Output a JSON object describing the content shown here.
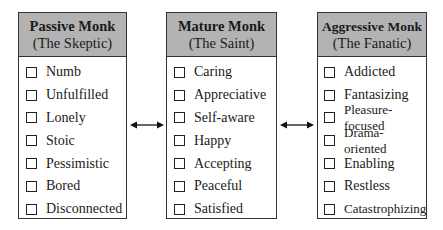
{
  "columns": [
    {
      "title": "Passive Monk",
      "subtitle": "(The Skeptic)",
      "items": [
        "Numb",
        "Unfulfilled",
        "Lonely",
        "Stoic",
        "Pessimistic",
        "Bored",
        "Disconnected"
      ]
    },
    {
      "title": "Mature Monk",
      "subtitle": "(The Saint)",
      "items": [
        "Caring",
        "Appreciative",
        "Self-aware",
        "Happy",
        "Accepting",
        "Peaceful",
        "Satisfied"
      ]
    },
    {
      "title": "Aggressive Monk",
      "subtitle": "(The Fanatic)",
      "items": [
        "Addicted",
        "Fantasizing",
        "Pleasure-focused",
        "Drama-oriented",
        "Enabling",
        "Restless",
        "Catastrophizing"
      ]
    }
  ],
  "arrows": [
    {
      "from": "Passive Monk",
      "to": "Mature Monk",
      "type": "bidirectional"
    },
    {
      "from": "Mature Monk",
      "to": "Aggressive Monk",
      "type": "bidirectional"
    }
  ],
  "colors": {
    "header_bg": "#b3b3b3",
    "border": "#333333"
  }
}
